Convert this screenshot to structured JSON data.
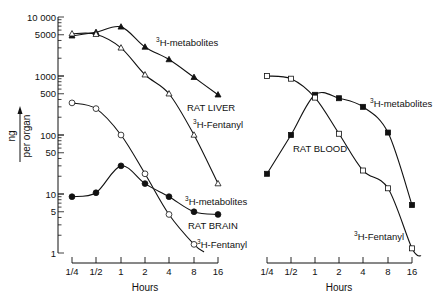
{
  "chart_data": [
    {
      "type": "line",
      "panel": "left",
      "title": "",
      "xlabel": "Hours",
      "ylabel": "ng per organ",
      "yscale": "log",
      "ylim": [
        1,
        10000
      ],
      "ytick_labels": [
        "10 000",
        "5000",
        "1000",
        "500",
        "100",
        "50",
        "10",
        "5",
        "1"
      ],
      "yticks": [
        10000,
        5000,
        1000,
        500,
        100,
        50,
        10,
        5,
        1
      ],
      "categories": [
        "1/4",
        "1/2",
        "1",
        "2",
        "4",
        "8",
        "16"
      ],
      "x": [
        0.25,
        0.5,
        1,
        2,
        4,
        8,
        16
      ],
      "grid": false,
      "legend": null,
      "series": [
        {
          "name": "RAT LIVER 3H-metabolites",
          "marker": "filled-triangle",
          "values": [
            4800,
            5500,
            6800,
            3100,
            1900,
            950,
            480
          ]
        },
        {
          "name": "RAT LIVER 3H-Fentanyl",
          "marker": "open-triangle",
          "values": [
            5200,
            5100,
            3000,
            1050,
            500,
            100,
            15
          ]
        },
        {
          "name": "RAT BRAIN 3H-metabolites",
          "marker": "filled-circle",
          "values": [
            9,
            10.5,
            30,
            15,
            9,
            5,
            4.5
          ]
        },
        {
          "name": "RAT BRAIN 3H-Fentanyl",
          "marker": "open-circle",
          "values": [
            350,
            280,
            100,
            22,
            4.5,
            1.4,
            null
          ]
        }
      ],
      "annotations": [
        "RAT LIVER",
        "3H-metabolites",
        "3H-Fentanyl",
        "RAT BRAIN",
        "3H-metabolites",
        "3H-Fentanyl"
      ]
    },
    {
      "type": "line",
      "panel": "right",
      "title": "",
      "xlabel": "Hours",
      "ylabel": "ng per organ",
      "yscale": "log",
      "ylim": [
        1,
        10000
      ],
      "categories": [
        "1/4",
        "1/2",
        "1",
        "2",
        "4",
        "8",
        "16"
      ],
      "x": [
        0.25,
        0.5,
        1,
        2,
        4,
        8,
        16
      ],
      "grid": false,
      "legend": null,
      "series": [
        {
          "name": "RAT BLOOD 3H-metabolites",
          "marker": "filled-square",
          "values": [
            22,
            100,
            480,
            420,
            300,
            110,
            6.5
          ]
        },
        {
          "name": "RAT BLOOD 3H-Fentanyl",
          "marker": "open-square",
          "values": [
            1000,
            900,
            430,
            105,
            25,
            12.5,
            1.2
          ]
        }
      ],
      "annotations": [
        "RAT BLOOD",
        "3H-metabolites",
        "3H-Fentanyl"
      ]
    }
  ],
  "labels": {
    "ylabel_top": "ng",
    "ylabel_bottom": "per organ",
    "xlabel_left": "Hours",
    "xlabel_right": "Hours",
    "rat_liver": "RAT LIVER",
    "rat_brain": "RAT BRAIN",
    "rat_blood": "RAT BLOOD",
    "iso": "3",
    "metabolites": "H-metabolites",
    "fentanyl": "H-Fentanyl"
  },
  "layout": {
    "y_top_px": 17,
    "decade_px": 59,
    "left_x_px": [
      72,
      96,
      121,
      145,
      169,
      194,
      218
    ],
    "right_x_px": [
      267,
      291,
      315,
      339,
      363,
      388,
      412
    ],
    "x_axis_y_px": 263
  }
}
